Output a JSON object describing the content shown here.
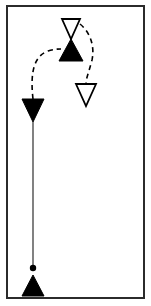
{
  "figure": {
    "title": "Trajectory diagram with triangular markers",
    "width": 151,
    "height": 306,
    "background_color": "#FFFFFF",
    "frame": {
      "name": "border-frame",
      "stroke_color": "#2B2B2B",
      "stroke_width": 2,
      "x": 7,
      "y": 6,
      "width": 137,
      "height": 292,
      "fill": "none"
    },
    "colors": {
      "ink": "#000000",
      "frame": "#2B2B2B",
      "fill_solid": "#000000",
      "fill_open": "#FFFFFF",
      "path_solid": "#1A1A1A",
      "path_dashed": "#000000"
    },
    "markers": [
      {
        "id": "marker-open-top",
        "label": "open-down-triangle-top",
        "shape": "triangle",
        "orientation": "down",
        "fill": "open",
        "cx": 71,
        "cy": 29,
        "half_width": 9,
        "height": 20,
        "apex_y": 39,
        "base_y": 19
      },
      {
        "id": "marker-solid-center",
        "label": "filled-up-triangle-center",
        "shape": "triangle",
        "orientation": "up",
        "fill": "solid",
        "cx": 71,
        "cy": 50,
        "half_width": 12,
        "height": 22,
        "apex_y": 39,
        "base_y": 61
      },
      {
        "id": "marker-open-lower-right",
        "label": "open-down-triangle-lower-right",
        "shape": "triangle",
        "orientation": "down",
        "fill": "open",
        "cx": 86,
        "cy": 95,
        "half_width": 10,
        "height": 22,
        "apex_y": 106,
        "base_y": 84
      },
      {
        "id": "marker-solid-left",
        "label": "filled-down-triangle-left",
        "shape": "triangle",
        "orientation": "down",
        "fill": "solid",
        "cx": 33,
        "cy": 110,
        "half_width": 11,
        "height": 23,
        "apex_y": 122,
        "base_y": 99
      },
      {
        "id": "marker-solid-bottom",
        "label": "filled-up-triangle-bottom",
        "shape": "triangle",
        "orientation": "up",
        "fill": "solid",
        "cx": 33,
        "cy": 286,
        "half_width": 11,
        "height": 21,
        "apex_y": 275,
        "base_y": 296
      }
    ],
    "nodes": [
      {
        "id": "node-dot-bottom",
        "label": "origin-dot",
        "shape": "circle",
        "fill": "solid",
        "cx": 33,
        "cy": 268,
        "r": 3.2
      }
    ],
    "paths": [
      {
        "id": "path-solid-vertical",
        "label": "solid-vertical-stem",
        "style": "solid",
        "stroke_width": 1.1,
        "from": "marker-solid-left",
        "to": "node-dot-bottom",
        "d": "M 33 122 L 33 266"
      },
      {
        "id": "path-dashed-left-arc",
        "label": "dashed-arc-left",
        "style": "dashed",
        "dash_pattern": "5,4",
        "stroke_width": 1.6,
        "from": "marker-solid-left",
        "to": "marker-solid-center",
        "d": "M 33 99 C 30 72 34 56 48 51 C 54 49 58 49 61 49"
      },
      {
        "id": "path-dashed-right-arc",
        "label": "dashed-arc-right",
        "style": "dashed",
        "dash_pattern": "5,4",
        "stroke_width": 1.6,
        "from": "marker-open-top",
        "to": "marker-open-lower-right",
        "d": "M 80 24 C 90 32 95 46 92 60 C 89 72 86 78 86 84"
      }
    ]
  }
}
